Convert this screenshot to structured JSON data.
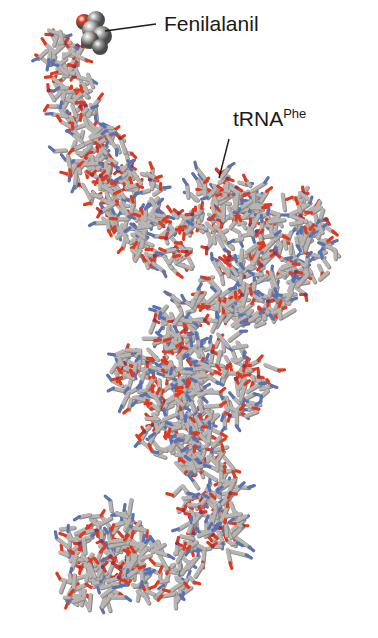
{
  "figure": {
    "labels": {
      "amino_acid": "Fenilalanil",
      "trna_main": "tRNA",
      "trna_superscript": "Phe"
    },
    "colors": {
      "background": "#ffffff",
      "carbon": "#b8b5b3",
      "carbon_shade": "#8e8b89",
      "oxygen": "#e0391c",
      "nitrogen": "#5a72b0",
      "phosphorus": "#7a3a6a",
      "text": "#1a1a1a"
    },
    "icons": {
      "space_filling_residue": "phenylalanyl-sphere-cluster",
      "molecule_model": "ball-and-stick-trna"
    }
  }
}
